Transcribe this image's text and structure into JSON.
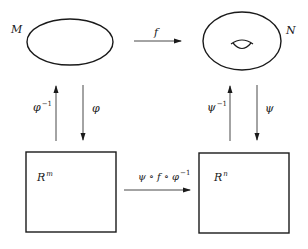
{
  "diagram": {
    "nodes": {
      "M": {
        "label": "M",
        "shape": "ellipse"
      },
      "N": {
        "label": "N",
        "shape": "torus"
      },
      "Rm": {
        "base": "R",
        "exp": "m",
        "shape": "square"
      },
      "Rn": {
        "base": "R",
        "exp": "n",
        "shape": "square"
      }
    },
    "edges": {
      "f": {
        "label": "f",
        "from": "M",
        "to": "N"
      },
      "phi_inv": {
        "base": "φ",
        "exp": "−1",
        "from": "Rm",
        "to": "M"
      },
      "phi": {
        "base": "φ",
        "from": "M",
        "to": "Rm"
      },
      "psi_inv": {
        "base": "ψ",
        "exp": "−1",
        "from": "Rn",
        "to": "N"
      },
      "psi": {
        "base": "ψ",
        "from": "N",
        "to": "Rn"
      },
      "composite": {
        "base": "ψ ∘ f ∘ φ",
        "exp": "−1",
        "from": "Rm",
        "to": "Rn"
      }
    },
    "colors": {
      "stroke": "#1a1a1a",
      "arrow": "#333333",
      "background": "#ffffff"
    }
  }
}
